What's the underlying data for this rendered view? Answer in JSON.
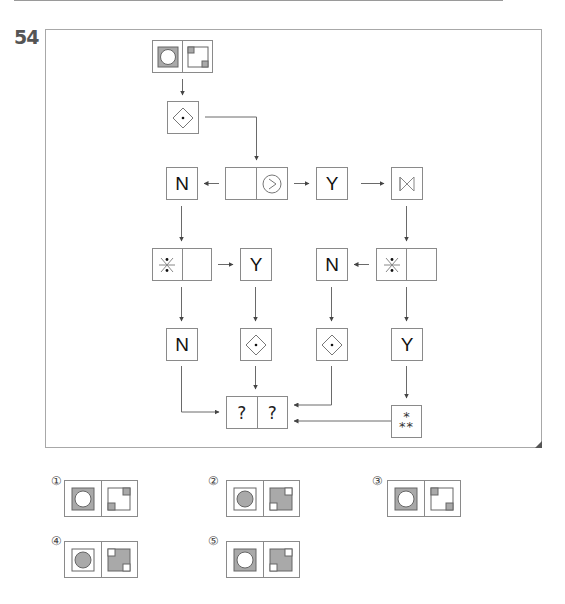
{
  "question": {
    "number": "54"
  },
  "diagram": {
    "start_box": {
      "left": "circle-in-gray-square",
      "right": "square-with-two-gray-corners"
    },
    "step_box": {
      "symbol": "diamond-with-dot"
    },
    "row2": {
      "left_output": "N",
      "condition_box": {
        "left": "",
        "right": "circled-greater-than"
      },
      "right_output": "Y",
      "right_next": "bowtie"
    },
    "row3": {
      "left_condition": {
        "left": "asterisk-with-dots",
        "right": ""
      },
      "left_condition_output": "Y",
      "right_condition_output": "N",
      "right_condition": {
        "left": "asterisk-with-dots",
        "right": ""
      }
    },
    "row4": {
      "col1": "N",
      "col2": "diamond-with-dot",
      "col3": "diamond-with-dot",
      "col4": "Y"
    },
    "result_box": {
      "left": "?",
      "right": "?"
    },
    "triple_asterisk": {
      "top": "*",
      "bottom": "**"
    }
  },
  "options": [
    {
      "label": "①",
      "left": "white circle in gray square",
      "right": "white square, gray top-right & bottom-left corners"
    },
    {
      "label": "②",
      "left": "gray circle in white square",
      "right": "gray square, white top-right & bottom-left corners"
    },
    {
      "label": "③",
      "left": "white circle in gray square",
      "right": "white square, gray top-left & bottom-right corners"
    },
    {
      "label": "④",
      "left": "gray circle in white square",
      "right": "gray square, white top-left & bottom-right corners"
    },
    {
      "label": "⑤",
      "left": "white circle in gray square",
      "right": "gray square, white top-right & bottom-left corners"
    }
  ],
  "colors": {
    "gray_fill": "#a9a9a9",
    "line": "#8a8a8a",
    "text": "#111111"
  }
}
